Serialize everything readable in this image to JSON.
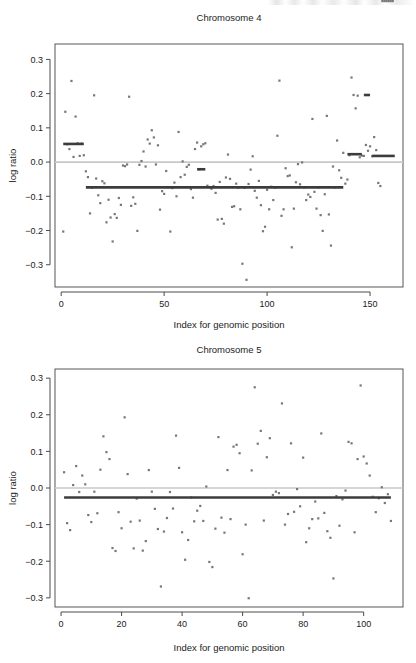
{
  "figure": {
    "background": "#ffffff",
    "point_color": "#777777",
    "segment_color": "#3c3c3c",
    "zero_line_color": "#c8c8c8",
    "frame_color": "#565656"
  },
  "chart_data": [
    {
      "id": "chromosome-4",
      "type": "scatter",
      "title": "Chromosome 4",
      "xlabel": "Index for genomic position",
      "ylabel": "log ratio",
      "xlim": [
        -3,
        166
      ],
      "ylim": [
        -0.365,
        0.345
      ],
      "xticks": [
        0,
        50,
        100,
        150
      ],
      "yticks": [
        0.3,
        0.2,
        0.1,
        0.0,
        -0.1,
        -0.2,
        -0.3
      ],
      "xtick_labels": [
        "0",
        "50",
        "100",
        "150"
      ],
      "ytick_labels": [
        "0.3",
        "0.2",
        "0.1",
        "0.0",
        "-0.1",
        "-0.2",
        "-0.3"
      ],
      "grid": false,
      "legend": null,
      "zero_line": 0.0,
      "segments": [
        {
          "x0": 1,
          "x1": 11,
          "y": 0.053
        },
        {
          "x0": 12,
          "x1": 137,
          "y": -0.074
        },
        {
          "x0": 66,
          "x1": 70,
          "y": -0.021
        },
        {
          "x0": 139,
          "x1": 146,
          "y": 0.023
        },
        {
          "x0": 147,
          "x1": 150,
          "y": 0.196
        },
        {
          "x0": 151,
          "x1": 162,
          "y": 0.018
        }
      ],
      "x": [
        1,
        2,
        3,
        4,
        5,
        6,
        7,
        8,
        9,
        10,
        11,
        12,
        13,
        14,
        15,
        16,
        17,
        18,
        19,
        20,
        21,
        22,
        23,
        24,
        25,
        26,
        27,
        28,
        29,
        30,
        31,
        32,
        33,
        34,
        35,
        36,
        37,
        38,
        39,
        40,
        41,
        42,
        43,
        44,
        45,
        46,
        47,
        48,
        49,
        50,
        51,
        52,
        53,
        54,
        55,
        56,
        57,
        58,
        59,
        60,
        61,
        62,
        63,
        64,
        65,
        66,
        67,
        68,
        69,
        70,
        71,
        72,
        73,
        74,
        75,
        76,
        77,
        78,
        79,
        80,
        81,
        82,
        83,
        84,
        85,
        86,
        87,
        88,
        89,
        90,
        91,
        92,
        93,
        94,
        95,
        96,
        97,
        98,
        99,
        100,
        101,
        102,
        103,
        104,
        105,
        106,
        107,
        108,
        109,
        110,
        111,
        112,
        113,
        114,
        115,
        116,
        117,
        118,
        119,
        120,
        121,
        122,
        123,
        124,
        125,
        126,
        127,
        128,
        129,
        130,
        131,
        132,
        133,
        134,
        135,
        136,
        137,
        138,
        139,
        140,
        141,
        142,
        143,
        144,
        145,
        146,
        147,
        148,
        149,
        150,
        151,
        152,
        153,
        154,
        155,
        156,
        157,
        158,
        159,
        160,
        161
      ],
      "y": [
        -0.203,
        0.147,
        0.052,
        0.038,
        0.237,
        0.015,
        0.133,
        0.055,
        0.018,
        0.054,
        0.02,
        -0.027,
        -0.044,
        -0.15,
        -0.075,
        0.195,
        -0.048,
        -0.097,
        -0.12,
        -0.056,
        -0.062,
        -0.176,
        -0.11,
        -0.162,
        -0.232,
        -0.152,
        -0.163,
        -0.105,
        -0.125,
        -0.01,
        -0.012,
        -0.007,
        0.191,
        -0.128,
        -0.103,
        -0.122,
        -0.201,
        -0.008,
        0.003,
        0.031,
        -0.013,
        0.066,
        0.054,
        0.093,
        0.072,
        -0.007,
        0.049,
        -0.139,
        -0.085,
        -0.093,
        -0.026,
        -0.073,
        -0.203,
        -0.076,
        -0.06,
        -0.1,
        0.088,
        -0.044,
        0.002,
        -0.037,
        -0.014,
        -0.008,
        -0.079,
        -0.104,
        0.038,
        0.057,
        -0.021,
        0.046,
        0.052,
        0.055,
        -0.069,
        -0.073,
        -0.078,
        -0.07,
        -0.09,
        -0.168,
        -0.058,
        -0.166,
        -0.18,
        -0.045,
        0.022,
        -0.049,
        -0.131,
        -0.129,
        -0.063,
        -0.075,
        -0.138,
        -0.297,
        -0.075,
        -0.344,
        -0.064,
        -0.022,
        0.017,
        -0.084,
        -0.104,
        -0.055,
        -0.126,
        -0.202,
        -0.189,
        -0.081,
        -0.138,
        -0.072,
        -0.111,
        -0.075,
        0.077,
        0.238,
        -0.157,
        -0.138,
        -0.018,
        -0.041,
        -0.039,
        -0.249,
        -0.136,
        -0.059,
        -0.006,
        -0.065,
        -0.001,
        -0.074,
        -0.111,
        -0.095,
        -0.102,
        0.126,
        -0.087,
        -0.136,
        -0.074,
        -0.155,
        -0.201,
        -0.094,
        0.135,
        -0.153,
        -0.244,
        -0.013,
        -0.074,
        0.063,
        -0.024,
        -0.046,
        0.027,
        -0.063,
        -0.051,
        0.02,
        0.247,
        0.196,
        0.157,
        0.194,
        0.014,
        0.019,
        0.018,
        0.05,
        0.033,
        0.046,
        0.017,
        0.073,
        0.035,
        -0.061,
        -0.07
      ]
    },
    {
      "id": "chromosome-5",
      "type": "scatter",
      "title": "Chromosome 5",
      "xlabel": "Index for genomic position",
      "ylabel": "log ratio",
      "xlim": [
        -2,
        113
      ],
      "ylim": [
        -0.325,
        0.325
      ],
      "xticks": [
        0,
        20,
        40,
        60,
        80,
        100
      ],
      "yticks": [
        0.3,
        0.2,
        0.1,
        0.0,
        -0.1,
        -0.2,
        -0.3
      ],
      "xtick_labels": [
        "0",
        "20",
        "40",
        "60",
        "80",
        "100"
      ],
      "ytick_labels": [
        "0.3",
        "0.2",
        "0.1",
        "0.0",
        "-0.1",
        "-0.2",
        "-0.3"
      ],
      "grid": false,
      "legend": null,
      "zero_line": 0.0,
      "segments": [
        {
          "x0": 1,
          "x1": 109,
          "y": -0.026
        }
      ],
      "x": [
        1,
        2,
        3,
        4,
        5,
        6,
        7,
        8,
        9,
        10,
        11,
        12,
        13,
        14,
        15,
        16,
        17,
        18,
        19,
        20,
        21,
        22,
        23,
        24,
        25,
        26,
        27,
        28,
        29,
        30,
        31,
        32,
        33,
        34,
        35,
        36,
        37,
        38,
        39,
        40,
        41,
        42,
        43,
        44,
        45,
        46,
        47,
        48,
        49,
        50,
        51,
        52,
        53,
        54,
        55,
        56,
        57,
        58,
        59,
        60,
        61,
        62,
        63,
        64,
        65,
        66,
        67,
        68,
        69,
        70,
        71,
        72,
        73,
        74,
        75,
        76,
        77,
        78,
        79,
        80,
        81,
        82,
        83,
        84,
        85,
        86,
        87,
        88,
        89,
        90,
        91,
        92,
        93,
        94,
        95,
        96,
        97,
        98,
        99,
        100,
        101,
        102,
        103,
        104,
        105,
        106,
        107,
        108,
        109
      ],
      "y": [
        0.043,
        -0.096,
        -0.115,
        0.008,
        0.06,
        -0.011,
        0.034,
        0.01,
        -0.074,
        -0.093,
        -0.01,
        -0.069,
        0.05,
        0.141,
        0.098,
        0.079,
        -0.164,
        -0.172,
        -0.066,
        -0.11,
        0.193,
        0.038,
        -0.092,
        -0.165,
        -0.029,
        -0.089,
        -0.171,
        -0.145,
        0.049,
        -0.01,
        -0.057,
        -0.112,
        -0.269,
        -0.119,
        -0.082,
        -0.011,
        -0.056,
        0.143,
        0.055,
        -0.121,
        -0.196,
        -0.142,
        -0.026,
        -0.091,
        -0.062,
        -0.049,
        -0.09,
        0.004,
        -0.202,
        -0.216,
        -0.111,
        0.139,
        -0.081,
        -0.122,
        0.049,
        -0.085,
        0.113,
        0.118,
        0.095,
        -0.181,
        -0.1,
        -0.301,
        0.048,
        0.275,
        0.121,
        0.156,
        -0.089,
        0.084,
        0.136,
        -0.019,
        -0.01,
        -0.014,
        0.231,
        -0.1,
        -0.071,
        0.122,
        -0.065,
        -0.003,
        -0.05,
        0.083,
        -0.148,
        -0.11,
        -0.085,
        -0.037,
        -0.083,
        0.149,
        -0.068,
        -0.118,
        -0.136,
        -0.247,
        -0.022,
        -0.103,
        -0.031,
        -0.007,
        0.126,
        0.122,
        -0.121,
        0.079,
        0.28,
        0.086,
        0.067,
        0.034,
        -0.024,
        -0.066,
        -0.028,
        0.002,
        -0.041,
        -0.017,
        -0.09
      ]
    }
  ]
}
